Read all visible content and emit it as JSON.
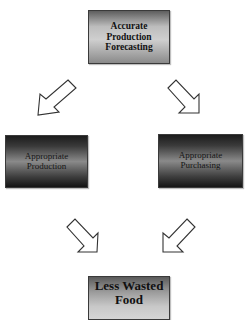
{
  "diagram": {
    "type": "flowchart",
    "nodes": [
      {
        "id": "forecasting",
        "label_lines": [
          "Accurate",
          "Production",
          "Forecasting"
        ]
      },
      {
        "id": "production",
        "label_lines": [
          "Appropriate",
          "Production"
        ]
      },
      {
        "id": "purchasing",
        "label_lines": [
          "Appropriate",
          "Purchasing"
        ]
      },
      {
        "id": "waste",
        "label_lines": [
          "Less Wasted",
          "Food"
        ]
      }
    ],
    "edges": [
      {
        "from": "forecasting",
        "to": "production"
      },
      {
        "from": "forecasting",
        "to": "purchasing"
      },
      {
        "from": "production",
        "to": "waste"
      },
      {
        "from": "purchasing",
        "to": "waste"
      }
    ]
  },
  "boxes": {
    "top": {
      "line1": "Accurate",
      "line2": "Production",
      "line3": "Forecasting"
    },
    "left": {
      "line1": "Appropriate",
      "line2": "Production"
    },
    "right": {
      "line1": "Appropriate",
      "line2": "Purchasing"
    },
    "bottom": {
      "line1": "Less Wasted",
      "line2": "Food"
    }
  }
}
